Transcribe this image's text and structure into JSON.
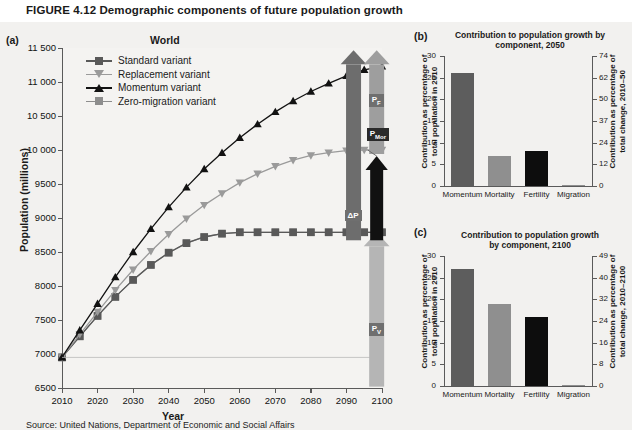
{
  "figure": {
    "label": "FIGURE 4.12",
    "title": "Demographic components of future population growth",
    "source": "Source: United Nations, Department of Economic and Social Affairs"
  },
  "panel_a": {
    "letter": "(a)",
    "title": "World",
    "xlabel": "Year",
    "ylabel": "Population (millions)",
    "legend": [
      {
        "label": "Standard variant",
        "marker": "square",
        "color": "#595959"
      },
      {
        "label": "Replacement variant",
        "marker": "triangle-down",
        "color": "#9a9a9a"
      },
      {
        "label": "Momentum variant",
        "marker": "triangle-up",
        "color": "#121212"
      },
      {
        "label": "Zero-migration variant",
        "marker": "square",
        "color": "#8d8d8d"
      }
    ],
    "annotations": [
      {
        "name": "delta-p",
        "label": "ΔP",
        "color": "#6d6d6d"
      },
      {
        "name": "p-fertility",
        "label": "P",
        "sub": "F",
        "color": "#9e9e9e"
      },
      {
        "name": "p-mortality",
        "label": "P",
        "sub": "Mor",
        "color": "#111111"
      },
      {
        "name": "p-momentum",
        "label": "P",
        "sub": "V",
        "color": "#b5b5b5"
      }
    ]
  },
  "chart_data": [
    {
      "name": "panel-a",
      "type": "line",
      "title": "World",
      "xlabel": "Year",
      "ylabel": "Population (millions)",
      "xlim": [
        2010,
        2100
      ],
      "ylim": [
        6500,
        11500
      ],
      "yticks": [
        "6500",
        "7000",
        "7500",
        "8000",
        "8500",
        "9000",
        "9500",
        "10 000",
        "10 500",
        "11 000",
        "11 500"
      ],
      "xticks": [
        "2010",
        "2020",
        "2030",
        "2040",
        "2050",
        "2060",
        "2070",
        "2080",
        "2090",
        "2100"
      ],
      "x": [
        2010,
        2015,
        2020,
        2025,
        2030,
        2035,
        2040,
        2045,
        2050,
        2055,
        2060,
        2065,
        2070,
        2075,
        2080,
        2085,
        2090,
        2095,
        2100
      ],
      "series": [
        {
          "name": "Momentum variant",
          "color": "#121212",
          "values": [
            6950,
            7350,
            7740,
            8130,
            8500,
            8840,
            9160,
            9450,
            9720,
            9960,
            10180,
            10380,
            10560,
            10720,
            10860,
            10980,
            11090,
            11180,
            11230
          ]
        },
        {
          "name": "Replacement variant",
          "color": "#9a9a9a",
          "values": [
            6950,
            7290,
            7620,
            7940,
            8240,
            8510,
            8760,
            8990,
            9190,
            9360,
            9520,
            9650,
            9760,
            9850,
            9920,
            9960,
            9990,
            10000,
            10000
          ]
        },
        {
          "name": "Standard variant",
          "color": "#595959",
          "values": [
            6950,
            7260,
            7560,
            7840,
            8090,
            8310,
            8490,
            8630,
            8720,
            8770,
            8790,
            8790,
            8790,
            8790,
            8790,
            8790,
            8790,
            8790,
            8790
          ]
        },
        {
          "name": "Zero-migration variant",
          "color": "#8d8d8d",
          "values": [
            6950,
            7260,
            7560,
            7840,
            8090,
            8310,
            8490,
            8630,
            8720,
            8770,
            8790,
            8790,
            8790,
            8790,
            8790,
            8790,
            8790,
            8790,
            8790
          ]
        }
      ],
      "grid": false,
      "legend_position": "top-left"
    },
    {
      "name": "panel-b",
      "type": "bar",
      "title": "Contribution to population growth by component, 2050",
      "categories": [
        "Momentum",
        "Mortality",
        "Fertility",
        "Migration"
      ],
      "values": [
        26,
        7,
        8,
        0.2
      ],
      "colors": [
        "#5d5d5d",
        "#8f8f8f",
        "#0d0d0d",
        "#8f8f8f"
      ],
      "ylabel": "Contribution as percentage of total population in 2010",
      "ylim": [
        0,
        30
      ],
      "yticks": [
        "0",
        "5",
        "10",
        "15",
        "20",
        "25",
        "30"
      ],
      "ylabel_right": "Contribution as percentage of total change, 2010–50",
      "yticks_right": [
        "0",
        "12",
        "24",
        "37",
        "50",
        "62",
        "74"
      ],
      "grid": false
    },
    {
      "name": "panel-c",
      "type": "bar",
      "title": "Contribution to population growth by component, 2100",
      "categories": [
        "Momentum",
        "Mortality",
        "Fertility",
        "Migration"
      ],
      "values": [
        27,
        19,
        16,
        0.2
      ],
      "colors": [
        "#5d5d5d",
        "#8f8f8f",
        "#0d0d0d",
        "#8f8f8f"
      ],
      "ylabel": "Contribution as percentage of total population in 2010",
      "ylim": [
        0,
        30
      ],
      "yticks": [
        "0",
        "5",
        "10",
        "15",
        "20",
        "25",
        "30"
      ],
      "ylabel_right": "Contribution as percentage of total change, 2010–2100",
      "yticks_right": [
        "0",
        "8",
        "16",
        "24",
        "32",
        "40",
        "49"
      ],
      "grid": false
    }
  ],
  "panel_b": {
    "letter": "(b)",
    "title_line1": "Contribution to population growth by",
    "title_line2": "component, 2050"
  },
  "panel_c": {
    "letter": "(c)",
    "title_line1": "Contribution to population growth",
    "title_line2": "by component, 2100"
  }
}
